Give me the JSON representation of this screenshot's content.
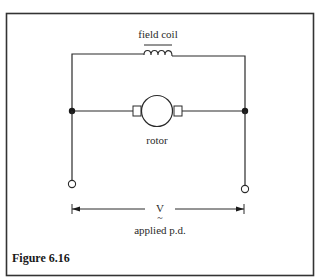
{
  "figure": {
    "caption": "Figure 6.16",
    "labels": {
      "field_coil": "field coil",
      "rotor": "rotor",
      "voltage_symbol": "V",
      "voltage_tilde": "~",
      "applied_pd": "applied p.d."
    },
    "colors": {
      "line": "#2a2a2a",
      "frame": "#333333",
      "background": "#ffffff"
    }
  },
  "diagram": {
    "type": "circuit",
    "title": "Figure 6.16",
    "components": [
      {
        "id": "field-coil",
        "kind": "inductor",
        "label": "field coil",
        "connection": "top branch between left and right rails"
      },
      {
        "id": "rotor",
        "kind": "motor-armature",
        "label": "rotor",
        "connection": "middle branch between junctions, with brush contacts"
      },
      {
        "id": "junction-left",
        "kind": "junction-dot"
      },
      {
        "id": "junction-right",
        "kind": "junction-dot"
      },
      {
        "id": "terminal-left",
        "kind": "open-terminal"
      },
      {
        "id": "terminal-right",
        "kind": "open-terminal"
      }
    ],
    "annotations": [
      {
        "text": "V",
        "note": "with tilde beneath; dimension arrow spans terminals"
      },
      {
        "text": "applied p.d."
      }
    ],
    "topology": "field coil and rotor connected in parallel (shunt) across the applied p.d."
  }
}
